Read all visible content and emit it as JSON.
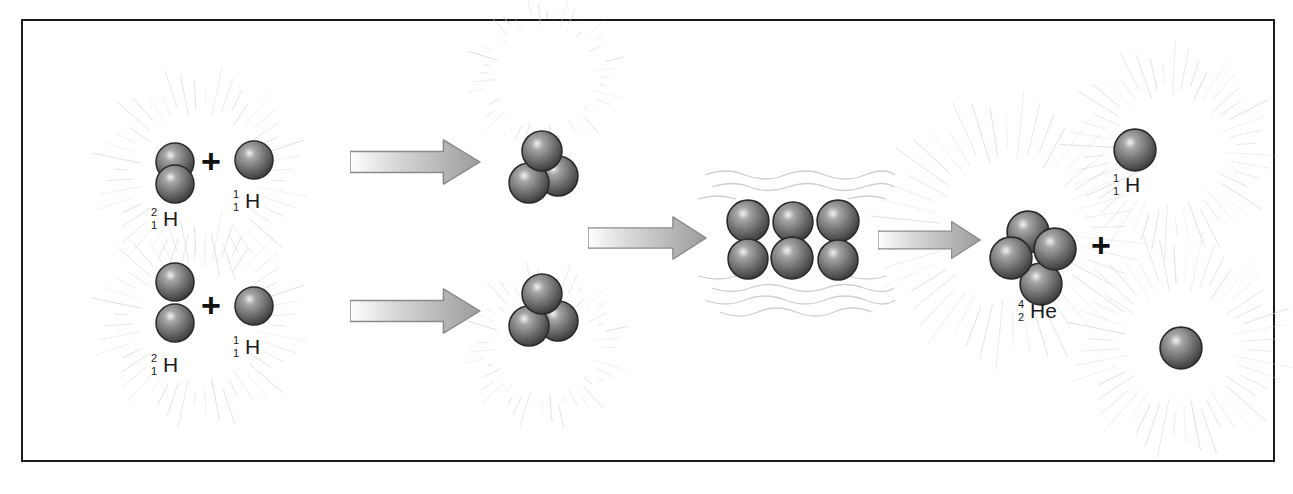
{
  "diagram": {
    "type": "proton-proton-chain-fusion",
    "stages": [
      {
        "name": "reactants",
        "rows": [
          {
            "a": {
              "symbol": "H",
              "mass": "2",
              "atomic": "1"
            },
            "op": "+",
            "b": {
              "symbol": "H",
              "mass": "1",
              "atomic": "1"
            }
          },
          {
            "a": {
              "symbol": "H",
              "mass": "2",
              "atomic": "1"
            },
            "op": "+",
            "b": {
              "symbol": "H",
              "mass": "1",
              "atomic": "1"
            }
          }
        ]
      },
      {
        "name": "helium-3-nuclei",
        "count": 2
      },
      {
        "name": "merging-nuclei",
        "count": 6
      },
      {
        "name": "products",
        "helium": {
          "symbol": "He",
          "mass": "4",
          "atomic": "2"
        },
        "op": "+",
        "proton": {
          "symbol": "H",
          "mass": "1",
          "atomic": "1"
        }
      }
    ],
    "colors": {
      "frame": "#1a1a1a",
      "nucleus": "#6e6e6e",
      "arrow": "#b9b9b9",
      "rays": "#d4d4d4"
    }
  }
}
